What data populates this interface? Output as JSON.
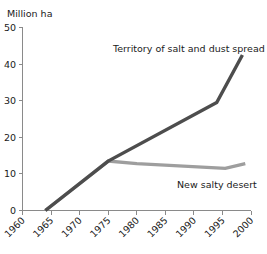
{
  "chart_data": {
    "type": "line",
    "title": "",
    "xlabel": "",
    "ylabel": "Million ha",
    "ylim": [
      0,
      50
    ],
    "xlim": [
      1960,
      2000
    ],
    "grid": false,
    "legend_position": "inline-annotations",
    "y_ticks": [
      "0",
      "10",
      "20",
      "30",
      "40",
      "50"
    ],
    "y_tick_values": [
      0,
      10,
      20,
      30,
      40,
      50
    ],
    "x_ticks": [
      "1960",
      "1965",
      "1970",
      "1975",
      "1980",
      "1985",
      "1990",
      "1995",
      "2000"
    ],
    "x_tick_values": [
      1960,
      1965,
      1970,
      1975,
      1980,
      1985,
      1990,
      1995,
      2000
    ],
    "x_tick_rotation_deg": 45,
    "series": [
      {
        "name": "Territory of salt and dust spread",
        "color": "#4d4d4d",
        "stroke_width": 3.4,
        "x": [
          1964,
          1975,
          1994,
          1998.5
        ],
        "values": [
          0,
          13.5,
          29.5,
          42.5
        ]
      },
      {
        "name": "New salty desert",
        "color": "#9e9e9e",
        "stroke_width": 3.4,
        "x": [
          1964,
          1975,
          1980,
          1995.5,
          1999
        ],
        "values": [
          0,
          13.5,
          12.8,
          11.5,
          12.8
        ]
      }
    ],
    "annotations": [
      {
        "text": "Territory of salt and dust spread",
        "for_series": "Territory of salt and dust spread",
        "x_px": 113,
        "y_px": 52
      },
      {
        "text": "New salty desert",
        "for_series": "New salty desert",
        "x_px": 177,
        "y_px": 188
      }
    ],
    "axis_colors": {
      "axis": "#8a8a8a",
      "text": "#1a1a1a",
      "background": "#ffffff"
    }
  }
}
